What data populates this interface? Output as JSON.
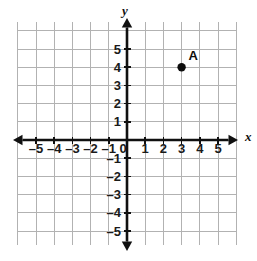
{
  "figure": {
    "kind": "coordinate-plane",
    "width": 257,
    "height": 261,
    "background": "#ffffff"
  },
  "chart_data": {
    "type": "scatter",
    "title": "",
    "xlabel": "x",
    "ylabel": "y",
    "xlim": [
      -6,
      6
    ],
    "ylim": [
      -6,
      6
    ],
    "grid": true,
    "legend": "none",
    "x_tick_labels": [
      "–5",
      "–4",
      "–3",
      "–2",
      "–1",
      "0",
      "1",
      "2",
      "3",
      "4",
      "5"
    ],
    "x_tick_values": [
      -5,
      -4,
      -3,
      -2,
      -1,
      0,
      1,
      2,
      3,
      4,
      5
    ],
    "y_tick_labels": [
      "5",
      "4",
      "3",
      "2",
      "1",
      "–1",
      "–2",
      "–3",
      "–4",
      "–5"
    ],
    "y_tick_values": [
      5,
      4,
      3,
      2,
      1,
      -1,
      -2,
      -3,
      -4,
      -5
    ],
    "origin_label": "0",
    "points": [
      {
        "label": "A",
        "x": 3,
        "y": 4,
        "color": "#0d0d0d"
      }
    ],
    "annotations": [
      {
        "text": "A",
        "x": 3,
        "y": 4,
        "position": "above-right"
      }
    ]
  },
  "colors": {
    "grid": "#b2b2b2",
    "axis": "#101010",
    "point": "#0d0d0d",
    "label": "#1a1a1a"
  },
  "geometry": {
    "origin_x": 127,
    "origin_y": 140,
    "unit_px": 18.2,
    "grid_left": 18,
    "grid_right": 236,
    "grid_top": 22,
    "grid_bottom": 245,
    "axis_x_start": 13,
    "axis_x_end": 238,
    "axis_y_start": 18,
    "axis_y_end": 251,
    "dot_radius": 4.2
  },
  "axis_names": {
    "x": "x",
    "y": "y"
  }
}
